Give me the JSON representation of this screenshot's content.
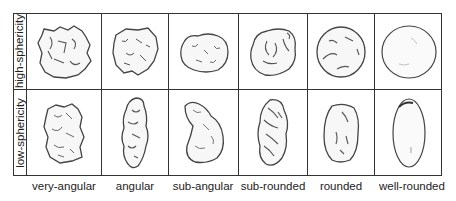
{
  "diagram": {
    "rows": [
      {
        "label": "high-sphericity"
      },
      {
        "label": "low-sphericity"
      }
    ],
    "columns": [
      {
        "label": "very-angular"
      },
      {
        "label": "angular"
      },
      {
        "label": "sub-angular"
      },
      {
        "label": "sub-rounded"
      },
      {
        "label": "rounded"
      },
      {
        "label": "well-rounded"
      }
    ],
    "colors": {
      "line": "#333333",
      "grain_fill": "#f7f7f7",
      "grain_stroke": "#444444",
      "background": "#ffffff"
    }
  }
}
